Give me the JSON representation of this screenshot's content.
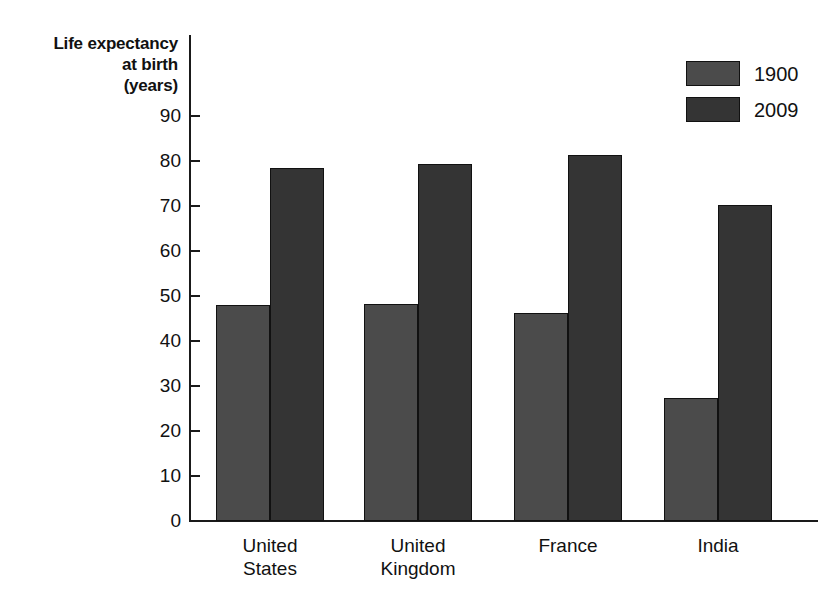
{
  "chart_data": {
    "type": "bar",
    "title": "",
    "ylabel": "Life expectancy at birth (years)",
    "ylabel_lines": [
      "Life expectancy",
      "at birth",
      "(years)"
    ],
    "xlabel": "",
    "categories": [
      "United States",
      "United Kingdom",
      "France",
      "India"
    ],
    "category_lines": [
      [
        "United",
        "States"
      ],
      [
        "United",
        "Kingdom"
      ],
      [
        "France"
      ],
      [
        "India"
      ]
    ],
    "series": [
      {
        "name": "1900",
        "values": [
          48.0,
          48.2,
          46.2,
          27.3
        ],
        "color": "#4b4b4b"
      },
      {
        "name": "2009",
        "values": [
          78.4,
          79.4,
          81.4,
          70.3
        ],
        "color": "#343434"
      }
    ],
    "ylim": [
      0,
      90
    ],
    "ytick_labels": [
      "90",
      "80",
      "70",
      "60",
      "50",
      "40",
      "30",
      "20",
      "10",
      "0"
    ],
    "ytick_values": [
      90,
      80,
      70,
      60,
      50,
      40,
      30,
      20,
      10,
      0
    ],
    "grid": false,
    "legend_position": "top-right",
    "legend_entries": [
      "1900",
      "2009"
    ]
  }
}
